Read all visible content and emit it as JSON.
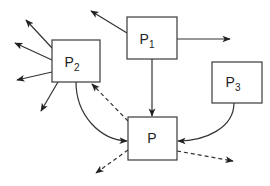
{
  "diagram": {
    "type": "process-graph",
    "nodes": [
      {
        "id": "P1",
        "base": "P",
        "sub": "1",
        "x": 127,
        "y": 17,
        "w": 50,
        "h": 42
      },
      {
        "id": "P2",
        "base": "P",
        "sub": "2",
        "x": 52,
        "y": 40,
        "w": 48,
        "h": 42
      },
      {
        "id": "P3",
        "base": "P",
        "sub": "3",
        "x": 212,
        "y": 62,
        "w": 50,
        "h": 41
      },
      {
        "id": "P",
        "base": "P",
        "sub": "",
        "x": 128,
        "y": 117,
        "w": 49,
        "h": 43
      }
    ],
    "edges": [
      {
        "from": "P1",
        "to": "external-top-left",
        "style": "solid"
      },
      {
        "from": "P1",
        "to": "external-right",
        "style": "solid"
      },
      {
        "from": "P1",
        "to": "P",
        "style": "solid"
      },
      {
        "from": "P2",
        "to": "external-upper-left",
        "style": "solid"
      },
      {
        "from": "P2",
        "to": "external-left",
        "style": "solid"
      },
      {
        "from": "P2",
        "to": "external-lower-left",
        "style": "solid"
      },
      {
        "from": "P2",
        "to": "external-down-left",
        "style": "solid"
      },
      {
        "from": "P2",
        "to": "P",
        "style": "solid-curved"
      },
      {
        "from": "P3",
        "to": "P",
        "style": "solid-curved"
      },
      {
        "from": "P",
        "to": "P2",
        "style": "dashed"
      },
      {
        "from": "P",
        "to": "external-bottom-left",
        "style": "dashed"
      },
      {
        "from": "P",
        "to": "external-bottom-right",
        "style": "dashed"
      }
    ],
    "colors": {
      "stroke": "#333333",
      "background": "#ffffff"
    }
  },
  "labels": {
    "p1": {
      "base": "P",
      "sub": "1"
    },
    "p2": {
      "base": "P",
      "sub": "2"
    },
    "p3": {
      "base": "P",
      "sub": "3"
    },
    "p": {
      "base": "P"
    }
  }
}
